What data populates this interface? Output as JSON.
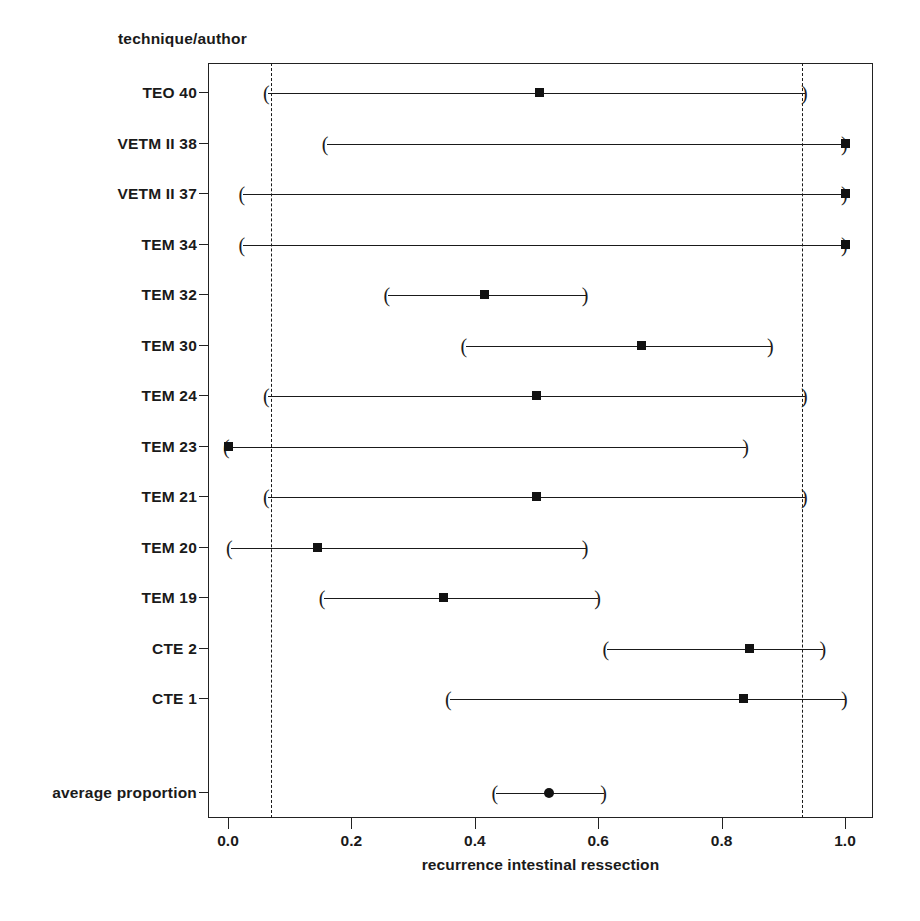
{
  "header": {
    "column_label": "technique/author"
  },
  "axis": {
    "x_title": "recurrence intestinal ressection",
    "x_ticks": [
      0.0,
      0.2,
      0.4,
      0.6,
      0.8,
      1.0
    ],
    "x_tick_labels": [
      "0.0",
      "0.2",
      "0.4",
      "0.6",
      "0.8",
      "1.0"
    ],
    "x_min": 0.0,
    "x_max": 1.0
  },
  "reference_lines": [
    0.07,
    0.93
  ],
  "colors": {
    "line": "#1a1a1a",
    "frame": "#222222",
    "marker": "#121212",
    "background": "#ffffff"
  },
  "chart_data": {
    "type": "forest",
    "title": "",
    "xlabel": "recurrence intestinal ressection",
    "ylabel": "technique/author",
    "xlim": [
      0.0,
      1.0
    ],
    "grid": false,
    "legend": "none",
    "reference_lines": [
      0.07,
      0.93
    ],
    "categories": [
      "TEO 40",
      "VETM II 38",
      "VETM II 37",
      "TEM 34",
      "TEM 32",
      "TEM 30",
      "TEM 24",
      "TEM 23",
      "TEM 21",
      "TEM 20",
      "TEM 19",
      "CTE 2",
      "CTE 1",
      "average proportion"
    ],
    "studies": [
      {
        "label": "TEO 40",
        "proportion": 0.505,
        "ci_low": 0.065,
        "ci_high": 0.935,
        "marker": "square",
        "summary": false
      },
      {
        "label": "VETM II 38",
        "proportion": 1.0,
        "ci_low": 0.16,
        "ci_high": 1.0,
        "marker": "square",
        "summary": false
      },
      {
        "label": "VETM II 37",
        "proportion": 1.0,
        "ci_low": 0.025,
        "ci_high": 1.0,
        "marker": "square",
        "summary": false
      },
      {
        "label": "TEM 34",
        "proportion": 1.0,
        "ci_low": 0.025,
        "ci_high": 1.0,
        "marker": "square",
        "summary": false
      },
      {
        "label": "TEM 32",
        "proportion": 0.415,
        "ci_low": 0.26,
        "ci_high": 0.58,
        "marker": "square",
        "summary": false
      },
      {
        "label": "TEM 30",
        "proportion": 0.67,
        "ci_low": 0.385,
        "ci_high": 0.88,
        "marker": "square",
        "summary": false
      },
      {
        "label": "TEM 24",
        "proportion": 0.5,
        "ci_low": 0.065,
        "ci_high": 0.935,
        "marker": "square",
        "summary": false
      },
      {
        "label": "TEM 23",
        "proportion": 0.0,
        "ci_low": 0.0,
        "ci_high": 0.84,
        "marker": "square",
        "summary": false
      },
      {
        "label": "TEM 21",
        "proportion": 0.5,
        "ci_low": 0.065,
        "ci_high": 0.935,
        "marker": "square",
        "summary": false
      },
      {
        "label": "TEM 20",
        "proportion": 0.145,
        "ci_low": 0.005,
        "ci_high": 0.58,
        "marker": "square",
        "summary": false
      },
      {
        "label": "TEM 19",
        "proportion": 0.35,
        "ci_low": 0.155,
        "ci_high": 0.6,
        "marker": "square",
        "summary": false
      },
      {
        "label": "CTE 2",
        "proportion": 0.845,
        "ci_low": 0.615,
        "ci_high": 0.965,
        "marker": "square",
        "summary": false
      },
      {
        "label": "CTE 1",
        "proportion": 0.835,
        "ci_low": 0.36,
        "ci_high": 1.0,
        "marker": "square",
        "summary": false
      },
      {
        "label": "average proportion",
        "proportion": 0.52,
        "ci_low": 0.435,
        "ci_high": 0.61,
        "marker": "dot",
        "summary": true
      }
    ]
  }
}
